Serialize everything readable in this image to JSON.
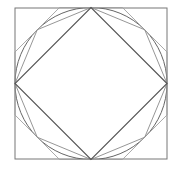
{
  "diagram": {
    "type": "geometric-construction",
    "canvas": {
      "width": 184,
      "height": 174,
      "background": "#ffffff"
    },
    "center": {
      "x": 91,
      "y": 83.5
    },
    "radius": 76,
    "colors": {
      "outer_square": "#777777",
      "circle": "#666666",
      "diamond": "#555555",
      "inscribed_octagon": "#8a8a8a",
      "circumscribed_octagon": "#a0a0a0"
    },
    "outer_square": {
      "x1": 15,
      "y1": 8,
      "x2": 167,
      "y2": 159
    },
    "labels": []
  }
}
